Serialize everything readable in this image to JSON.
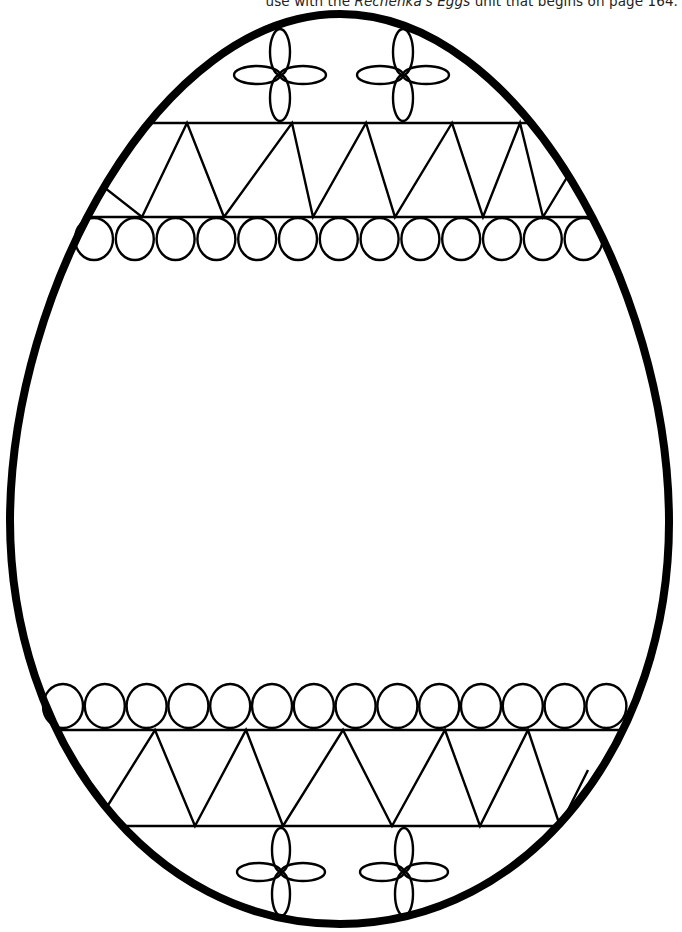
{
  "caption": {
    "prefix": "use with the ",
    "title_italic": "Rechenka's Eggs",
    "suffix": " unit that begins on page 164."
  },
  "colors": {
    "line": "#000000",
    "background": "#ffffff"
  },
  "egg": {
    "outline_stroke_width": 8,
    "top_y": 10,
    "bottom_y": 926,
    "left_x": 6,
    "right_x": 673
  },
  "decorations": {
    "top_flowers": [
      {
        "cx": 280,
        "cy": 75
      },
      {
        "cx": 403,
        "cy": 75
      }
    ],
    "bottom_flowers": [
      {
        "cx": 281,
        "cy": 871
      },
      {
        "cx": 404,
        "cy": 871
      }
    ],
    "top_zigzag": {
      "top_y": 123,
      "bottom_y": 216,
      "apexes_top_x": [
        147,
        296,
        393,
        481
      ],
      "valleys_bottom_x": [
        82,
        148,
        238,
        314,
        403,
        493,
        576
      ]
    },
    "top_circle_row": {
      "count": 13,
      "y": 239,
      "r": 19,
      "start_x": 94,
      "step": 40.8
    },
    "bottom_circle_row": {
      "count": 14,
      "y": 706,
      "r": 20,
      "start_x": 63,
      "step": 41.8
    },
    "bottom_zigzag": {
      "top_y": 730,
      "bottom_y": 826
    }
  }
}
